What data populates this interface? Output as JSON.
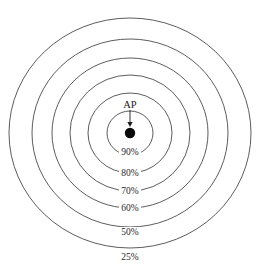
{
  "diagram": {
    "center_marker": {
      "name": "AP",
      "label": "AP",
      "x": 130,
      "y": 133,
      "dot_radius": 5.2,
      "color": "#0a0a0a"
    },
    "annotation_arrow": {
      "from_x": 130,
      "from_y": 110,
      "to_x": 130,
      "to_y": 127
    },
    "ap_label_position": {
      "x": 130,
      "y": 108
    },
    "stroke_color": "#4a4a4a",
    "background_color": "#ffffff"
  },
  "chart_data": {
    "type": "pie",
    "xlabel": "",
    "ylabel": "",
    "categories": [
      "90%",
      "80%",
      "70%",
      "60%",
      "50%",
      "25%"
    ],
    "values": [
      90,
      80,
      70,
      60,
      50,
      25
    ],
    "annotations": [
      "AP"
    ],
    "legend_position": "none",
    "grid": false,
    "rings": [
      {
        "label": "90%",
        "value": 90,
        "rx": 23,
        "ry": 22,
        "label_x": 130,
        "label_y": 155
      },
      {
        "label": "80%",
        "value": 80,
        "rx": 42,
        "ry": 40,
        "label_x": 130,
        "label_y": 176
      },
      {
        "label": "70%",
        "value": 70,
        "rx": 60,
        "ry": 58,
        "label_x": 130,
        "label_y": 194
      },
      {
        "label": "60%",
        "value": 60,
        "rx": 78,
        "ry": 75,
        "label_x": 130,
        "label_y": 211
      },
      {
        "label": "50%",
        "value": 50,
        "rx": 98,
        "ry": 94,
        "label_x": 130,
        "label_y": 235
      },
      {
        "label": "25%",
        "value": 25,
        "rx": 121,
        "ry": 115,
        "label_x": 130,
        "label_y": 260
      }
    ]
  }
}
